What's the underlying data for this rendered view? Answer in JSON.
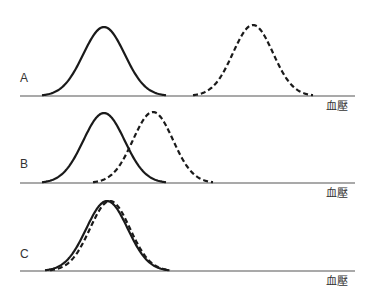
{
  "figure": {
    "width": 374,
    "height": 300,
    "line_color": "#1a1a1a",
    "axis_color": "#555555",
    "panels": [
      {
        "id": "A",
        "label": "A",
        "axis_label": "血壓",
        "baseline_y": 96,
        "axis_x_start": 20,
        "axis_x_end": 355,
        "label_pos": {
          "x": 20,
          "y": 72
        },
        "axis_label_pos": {
          "x": 326,
          "y": 101
        },
        "curves": [
          {
            "style": "solid",
            "center_x": 104,
            "peak_y": 27,
            "half_width": 62
          },
          {
            "style": "dashed",
            "center_x": 253,
            "peak_y": 25,
            "half_width": 60
          }
        ]
      },
      {
        "id": "B",
        "label": "B",
        "axis_label": "血壓",
        "baseline_y": 183,
        "axis_x_start": 20,
        "axis_x_end": 355,
        "label_pos": {
          "x": 20,
          "y": 158
        },
        "axis_label_pos": {
          "x": 326,
          "y": 188
        },
        "curves": [
          {
            "style": "solid",
            "center_x": 104,
            "peak_y": 113,
            "half_width": 62
          },
          {
            "style": "dashed",
            "center_x": 153,
            "peak_y": 112,
            "half_width": 60
          }
        ]
      },
      {
        "id": "C",
        "label": "C",
        "axis_label": "血壓",
        "baseline_y": 271,
        "axis_x_start": 20,
        "axis_x_end": 355,
        "label_pos": {
          "x": 20,
          "y": 248
        },
        "axis_label_pos": {
          "x": 326,
          "y": 276
        },
        "curves": [
          {
            "style": "solid",
            "center_x": 107,
            "peak_y": 201,
            "half_width": 62
          },
          {
            "style": "dashed",
            "center_x": 110,
            "peak_y": 201,
            "half_width": 60
          }
        ]
      }
    ]
  }
}
